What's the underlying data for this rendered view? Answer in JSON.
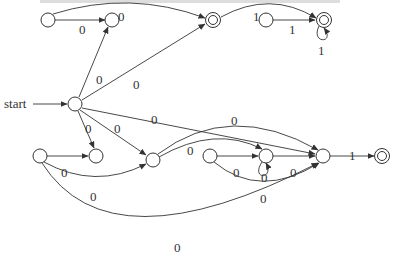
{
  "diagram": {
    "type": "finite-automaton",
    "start_label": "start",
    "nodes": [
      {
        "id": "A",
        "accepting": false
      },
      {
        "id": "B",
        "accepting": false
      },
      {
        "id": "C",
        "accepting": true
      },
      {
        "id": "D",
        "accepting": false
      },
      {
        "id": "E",
        "accepting": true
      },
      {
        "id": "S",
        "accepting": false,
        "start": true
      },
      {
        "id": "F",
        "accepting": false
      },
      {
        "id": "G",
        "accepting": false
      },
      {
        "id": "H",
        "accepting": false
      },
      {
        "id": "I",
        "accepting": false
      },
      {
        "id": "J",
        "accepting": false
      },
      {
        "id": "K",
        "accepting": false
      },
      {
        "id": "L",
        "accepting": true
      }
    ],
    "edges": [
      {
        "from": "A",
        "to": "B",
        "label": "0"
      },
      {
        "from": "A",
        "to": "C",
        "label": "0"
      },
      {
        "from": "C",
        "to": "E",
        "label": "1"
      },
      {
        "from": "D",
        "to": "E",
        "label": "1"
      },
      {
        "from": "E",
        "to": "E",
        "label": "1"
      },
      {
        "from": "S",
        "to": "B",
        "label": "0"
      },
      {
        "from": "S",
        "to": "C",
        "label": "0"
      },
      {
        "from": "S",
        "to": "K",
        "label": "0"
      },
      {
        "from": "S",
        "to": "F",
        "label": "0"
      },
      {
        "from": "S",
        "to": "H",
        "label": "0"
      },
      {
        "from": "G",
        "to": "F",
        "label": "0"
      },
      {
        "from": "G",
        "to": "H",
        "label": "0"
      },
      {
        "from": "G",
        "to": "K",
        "label": "0"
      },
      {
        "from": "H",
        "to": "K",
        "label": "0"
      },
      {
        "from": "H",
        "to": "J",
        "label": "0"
      },
      {
        "from": "I",
        "to": "J",
        "label": "0"
      },
      {
        "from": "I",
        "to": "K",
        "label": "0"
      },
      {
        "from": "J",
        "to": "J",
        "label": "0"
      },
      {
        "from": "J",
        "to": "K",
        "label": "0"
      },
      {
        "from": "K",
        "to": "L",
        "label": "1"
      }
    ]
  }
}
